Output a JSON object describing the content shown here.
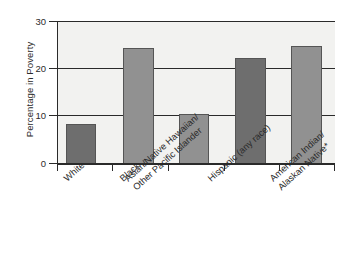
{
  "chart_data": {
    "type": "bar",
    "title": "",
    "xlabel": "",
    "ylabel": "Percentage in Poverty",
    "ylim": [
      0,
      30
    ],
    "yticks": [
      0,
      10,
      20,
      30
    ],
    "ytick_labels": [
      "0",
      "10",
      "20",
      "30"
    ],
    "grid": "horizontal",
    "legend": "none",
    "categories": [
      "White",
      "Black",
      "Asian/Native Hawaiian/ Other Pacific Islander",
      "Hispanic (any race)",
      "American Indian/ Alaskan Native*"
    ],
    "category_lines": [
      [
        "White"
      ],
      [
        "Black"
      ],
      [
        "Asian/Native Hawaiian/",
        "Other Pacific Islander"
      ],
      [
        "Hispanic (any race)"
      ],
      [
        "American Indian/",
        "Alaskan Native*"
      ]
    ],
    "values": [
      8.4,
      24.3,
      10.4,
      22.2,
      24.7
    ],
    "bar_colors": [
      "#6e6e6e",
      "#919191",
      "#919191",
      "#6e6e6e",
      "#919191"
    ],
    "plot_background": "#f2f2f0",
    "axis_color": "#2a2a2a",
    "footnote": "*"
  }
}
